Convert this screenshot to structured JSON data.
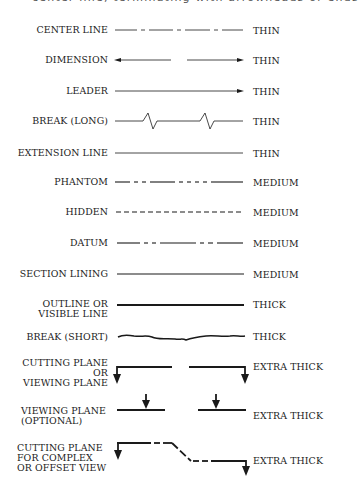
{
  "header": {
    "partial_text": "center line, terminating with arrowheads or ends"
  },
  "rows": [
    {
      "label": "CENTER LINE",
      "weight": "THIN",
      "style": "center-line"
    },
    {
      "label": "DIMENSION",
      "weight": "THIN",
      "style": "dimension"
    },
    {
      "label": "LEADER",
      "weight": "THIN",
      "style": "leader"
    },
    {
      "label": "BREAK (LONG)",
      "weight": "THIN",
      "style": "break-long"
    },
    {
      "label": "EXTENSION LINE",
      "weight": "THIN",
      "style": "extension"
    },
    {
      "label": "PHANTOM",
      "weight": "MEDIUM",
      "style": "phantom"
    },
    {
      "label": "HIDDEN",
      "weight": "MEDIUM",
      "style": "hidden"
    },
    {
      "label": "DATUM",
      "weight": "MEDIUM",
      "style": "datum"
    },
    {
      "label": "SECTION LINING",
      "weight": "MEDIUM",
      "style": "section-lining"
    },
    {
      "label_lines": [
        "OUTLINE OR",
        "VISIBLE LINE"
      ],
      "weight": "THICK",
      "style": "outline"
    },
    {
      "label": "BREAK (SHORT)",
      "weight": "THICK",
      "style": "break-short"
    },
    {
      "label_lines": [
        "CUTTING PLANE",
        "OR",
        "VIEWING PLANE"
      ],
      "weight": "EXTRA THICK",
      "style": "cutting-plane"
    },
    {
      "label_lines": [
        "VIEWING PLANE",
        "(OPTIONAL)"
      ],
      "weight": "EXTRA THICK",
      "style": "viewing-plane-optional"
    },
    {
      "label_lines": [
        "CUTTING PLANE",
        "FOR COMPLEX",
        "OR OFFSET VIEW"
      ],
      "weight": "EXTRA THICK",
      "style": "cutting-plane-offset"
    }
  ],
  "colors": {
    "ink": "#1a1a1a",
    "background": "#ffffff"
  }
}
